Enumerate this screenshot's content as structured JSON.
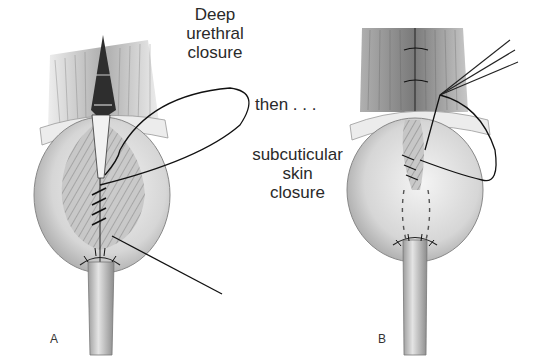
{
  "figure": {
    "panels": [
      {
        "id": "A",
        "letter": "A",
        "caption_lines": [
          "Deep",
          "urethral",
          "closure"
        ]
      },
      {
        "id": "B",
        "letter": "B",
        "caption_lines": [
          "subcuticular",
          "skin",
          "closure"
        ]
      }
    ],
    "connector_text": "then . . .",
    "colors": {
      "background": "#ffffff",
      "ink": "#1a1a1a",
      "tissue_light": "#e6e6e6",
      "tissue_mid": "#bdbdbd",
      "tissue_dark": "#6e6e6e",
      "muscle": "#8a8a8a"
    }
  }
}
